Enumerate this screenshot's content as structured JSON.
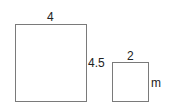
{
  "diagram": {
    "type": "similar-rectangles",
    "shapes": [
      {
        "id": "large-rectangle",
        "width_label": "4",
        "height_label": "4.5"
      },
      {
        "id": "small-rectangle",
        "width_label": "2",
        "height_label": "m"
      }
    ],
    "line_color": "#7a7a7a",
    "text_color": "#222222"
  }
}
